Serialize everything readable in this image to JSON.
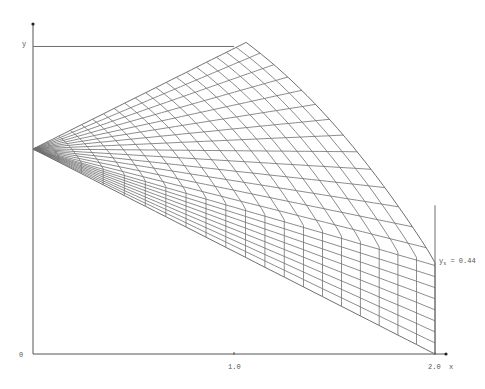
{
  "figure": {
    "axes": {
      "x_label": "x",
      "y_label": "y",
      "origin_label": "0",
      "x_ticks": [
        {
          "value": 1.0,
          "label": "1.0"
        },
        {
          "value": 2.0,
          "label": "2.0"
        }
      ],
      "origin_px": [
        33,
        354
      ],
      "scale_px_per_unit": 201
    },
    "annotation": {
      "symbol": "y",
      "subscript": "s",
      "text": " = 0.44"
    },
    "mesh": {
      "left_vertex": [
        0.0,
        1.02
      ],
      "top_corner": [
        1.06,
        1.55
      ],
      "sonic_point": [
        2.0,
        0.46
      ],
      "bottom_corner": [
        2.0,
        0.0
      ],
      "top_line_end_x": 1.0,
      "right_vertical_top_y": 0.74,
      "s_divisions": 20,
      "t_divisions": 22,
      "right_curve_fraction": 0.62
    },
    "colors": {
      "line": "#6f6f6f",
      "axis": "#555555",
      "background": "#ffffff"
    }
  }
}
